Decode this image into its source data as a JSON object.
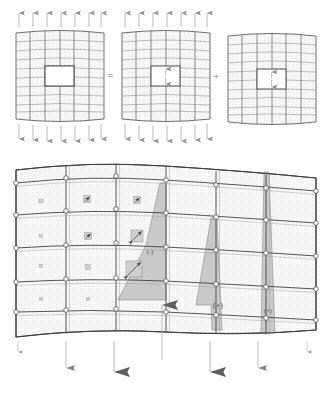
{
  "figure": {
    "background_color": "#ffffff",
    "mesh_line_color": "#6e6e6e",
    "mesh_line_color_dark": "#4a4a4a",
    "cell_fill_light": "#f6f6f6",
    "cell_fill_shaded": "#ececec",
    "wedge_fill": "#c9c9c9",
    "wedge_stroke": "#8a8a8a",
    "arrow_color": "#9a9a9a",
    "arrow_color_dark": "#7a7a7a",
    "node_fill": "#ffffff",
    "node_stroke": "#555555"
  },
  "top_row": {
    "operators": [
      {
        "id": "equals",
        "symbol": "=",
        "x": 110,
        "y": 79
      },
      {
        "id": "plus",
        "symbol": "+",
        "x": 216,
        "y": 79
      }
    ],
    "panels": [
      {
        "id": "panel-total",
        "name": "perforated-plate-total",
        "origin_x": 16,
        "origin_y": 30,
        "width": 88,
        "height": 92,
        "cols": 6,
        "rows": 9,
        "hole": {
          "col_start": 2,
          "col_end": 4,
          "row_start": 4,
          "row_end": 6
        },
        "hole_has_internal_arrows": false,
        "top_arrows": 7,
        "bottom_arrows": 7,
        "arrow_direction_top": "up",
        "arrow_direction_bottom": "down"
      },
      {
        "id": "panel-remote",
        "name": "plate-remote-tension",
        "origin_x": 122,
        "origin_y": 30,
        "width": 88,
        "height": 92,
        "cols": 6,
        "rows": 9,
        "hole": {
          "col_start": 2,
          "col_end": 4,
          "row_start": 4,
          "row_end": 6
        },
        "hole_has_internal_arrows": true,
        "top_arrows": 7,
        "bottom_arrows": 7,
        "arrow_direction_top": "up",
        "arrow_direction_bottom": "down"
      },
      {
        "id": "panel-correction",
        "name": "plate-hole-correction",
        "origin_x": 228,
        "origin_y": 30,
        "width": 88,
        "height": 92,
        "cols": 6,
        "rows": 9,
        "hole": {
          "col_start": 2,
          "col_end": 4,
          "row_start": 4,
          "row_end": 6
        },
        "hole_has_internal_arrows": true,
        "top_arrows": 0,
        "bottom_arrows": 0,
        "arrow_direction_top": "none",
        "arrow_direction_bottom": "none"
      }
    ]
  },
  "bottom_panel": {
    "id": "panel-stress-field",
    "name": "finite-element-stress-field",
    "origin_x": 16,
    "origin_y": 163,
    "width": 300,
    "height": 175,
    "cols": 6,
    "rows": 5,
    "sign_labels": [
      {
        "id": "label-minus",
        "text": "(-)",
        "x": 150,
        "y": 252
      },
      {
        "id": "label-plus-1",
        "text": "(+)",
        "x": 218,
        "y": 306
      },
      {
        "id": "label-plus-2",
        "text": "(+)",
        "x": 267,
        "y": 311
      }
    ],
    "stress_markers": [
      {
        "id": "marker-r1c1",
        "cx": 41,
        "cy": 201,
        "size": 4,
        "arrow": false
      },
      {
        "id": "marker-r1c2",
        "cx": 87,
        "cy": 199,
        "size": 7,
        "arrow": true
      },
      {
        "id": "marker-r1c3",
        "cx": 137,
        "cy": 200,
        "size": 7,
        "arrow": true
      },
      {
        "id": "marker-r2c1",
        "cx": 41,
        "cy": 236,
        "size": 3,
        "arrow": false
      },
      {
        "id": "marker-r2c2",
        "cx": 88,
        "cy": 236,
        "size": 7,
        "arrow": true
      },
      {
        "id": "marker-r2c3",
        "cx": 137,
        "cy": 236,
        "size": 12,
        "arrow": true
      },
      {
        "id": "marker-r3c1",
        "cx": 41,
        "cy": 266,
        "size": 3,
        "arrow": false
      },
      {
        "id": "marker-r3c2",
        "cx": 88,
        "cy": 267,
        "size": 5,
        "arrow": false
      },
      {
        "id": "marker-r3c3",
        "cx": 134,
        "cy": 269,
        "size": 16,
        "arrow": true
      },
      {
        "id": "marker-r4c1",
        "cx": 41,
        "cy": 299,
        "size": 3,
        "arrow": false
      },
      {
        "id": "marker-r4c2",
        "cx": 88,
        "cy": 299,
        "size": 3,
        "arrow": false
      }
    ],
    "reaction_arrow_up": {
      "id": "reaction-up-arrow",
      "x": 162,
      "y_top": 303,
      "y_bottom": 360,
      "head_size": "large"
    },
    "traction_arrows_down": [
      {
        "id": "down-arrow-1",
        "x": 18,
        "y_top": 340,
        "y_bottom": 355,
        "head_size": "tiny"
      },
      {
        "id": "down-arrow-2",
        "x": 66,
        "y_top": 340,
        "y_bottom": 372,
        "head_size": "small"
      },
      {
        "id": "down-arrow-3",
        "x": 114,
        "y_top": 340,
        "y_bottom": 385,
        "head_size": "large"
      },
      {
        "id": "down-arrow-4",
        "x": 210,
        "y_top": 340,
        "y_bottom": 385,
        "head_size": "large"
      },
      {
        "id": "down-arrow-5",
        "x": 258,
        "y_top": 340,
        "y_bottom": 372,
        "head_size": "small"
      },
      {
        "id": "down-arrow-6",
        "x": 307,
        "y_top": 340,
        "y_bottom": 355,
        "head_size": "tiny"
      }
    ]
  }
}
